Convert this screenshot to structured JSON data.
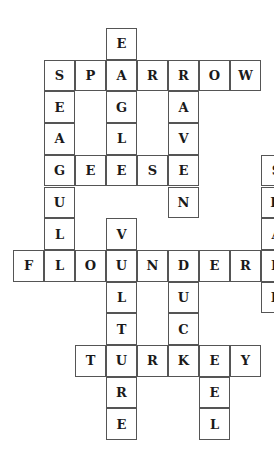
{
  "puzzle": {
    "cell_size": [
      31,
      31.7
    ],
    "cells": [
      {
        "r": 0,
        "c": 3,
        "l": "E"
      },
      {
        "r": 1,
        "c": 1,
        "l": "S"
      },
      {
        "r": 1,
        "c": 2,
        "l": "P"
      },
      {
        "r": 1,
        "c": 3,
        "l": "A"
      },
      {
        "r": 1,
        "c": 4,
        "l": "R"
      },
      {
        "r": 1,
        "c": 5,
        "l": "R"
      },
      {
        "r": 1,
        "c": 6,
        "l": "O"
      },
      {
        "r": 1,
        "c": 7,
        "l": "W"
      },
      {
        "r": 2,
        "c": 1,
        "l": "E"
      },
      {
        "r": 2,
        "c": 3,
        "l": "G"
      },
      {
        "r": 2,
        "c": 5,
        "l": "A"
      },
      {
        "r": 3,
        "c": 1,
        "l": "A"
      },
      {
        "r": 3,
        "c": 3,
        "l": "L"
      },
      {
        "r": 3,
        "c": 5,
        "l": "V"
      },
      {
        "r": 4,
        "c": 1,
        "l": "G"
      },
      {
        "r": 4,
        "c": 2,
        "l": "E"
      },
      {
        "r": 4,
        "c": 3,
        "l": "E"
      },
      {
        "r": 4,
        "c": 4,
        "l": "S"
      },
      {
        "r": 4,
        "c": 5,
        "l": "E"
      },
      {
        "r": 4,
        "c": 8,
        "l": "S"
      },
      {
        "r": 5,
        "c": 1,
        "l": "U"
      },
      {
        "r": 5,
        "c": 5,
        "l": "N"
      },
      {
        "r": 5,
        "c": 8,
        "l": "H"
      },
      {
        "r": 6,
        "c": 1,
        "l": "L"
      },
      {
        "r": 6,
        "c": 3,
        "l": "V"
      },
      {
        "r": 6,
        "c": 8,
        "l": "A"
      },
      {
        "r": 7,
        "c": 0,
        "l": "F"
      },
      {
        "r": 7,
        "c": 1,
        "l": "L"
      },
      {
        "r": 7,
        "c": 2,
        "l": "O"
      },
      {
        "r": 7,
        "c": 3,
        "l": "U"
      },
      {
        "r": 7,
        "c": 4,
        "l": "N"
      },
      {
        "r": 7,
        "c": 5,
        "l": "D"
      },
      {
        "r": 7,
        "c": 6,
        "l": "E"
      },
      {
        "r": 7,
        "c": 7,
        "l": "R"
      },
      {
        "r": 7,
        "c": 8,
        "l": "R"
      },
      {
        "r": 8,
        "c": 3,
        "l": "L"
      },
      {
        "r": 8,
        "c": 5,
        "l": "U"
      },
      {
        "r": 8,
        "c": 8,
        "l": "K"
      },
      {
        "r": 9,
        "c": 3,
        "l": "T"
      },
      {
        "r": 9,
        "c": 5,
        "l": "C"
      },
      {
        "r": 10,
        "c": 2,
        "l": "T"
      },
      {
        "r": 10,
        "c": 3,
        "l": "U"
      },
      {
        "r": 10,
        "c": 4,
        "l": "R"
      },
      {
        "r": 10,
        "c": 5,
        "l": "K"
      },
      {
        "r": 10,
        "c": 6,
        "l": "E"
      },
      {
        "r": 10,
        "c": 7,
        "l": "Y"
      },
      {
        "r": 11,
        "c": 3,
        "l": "R"
      },
      {
        "r": 11,
        "c": 6,
        "l": "E"
      },
      {
        "r": 12,
        "c": 3,
        "l": "E"
      },
      {
        "r": 12,
        "c": 6,
        "l": "L"
      }
    ],
    "words": [
      "SPARROW",
      "SEAGULL",
      "EAGLE",
      "RAVEN",
      "GEESE",
      "SHARK",
      "VULTURE",
      "FLOUNDER",
      "DUCK",
      "TURKEY",
      "EEL"
    ]
  }
}
